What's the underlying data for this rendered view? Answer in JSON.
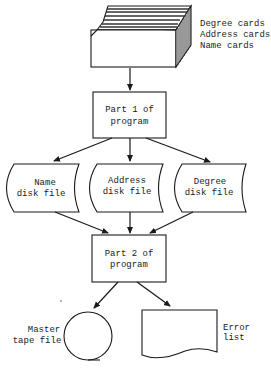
{
  "diagram": {
    "type": "flowchart",
    "colors": {
      "stroke": "#1a1a1a",
      "fill": "#ffffff",
      "text": "#222222"
    },
    "input": {
      "shape": "card-deck",
      "labels": [
        "Degree cards",
        "Address cards",
        "Name cards"
      ]
    },
    "part1": {
      "shape": "process",
      "lines": [
        "Part 1 of",
        "program"
      ]
    },
    "disk_files": [
      {
        "shape": "stored-data",
        "lines": [
          "Name",
          "disk file"
        ]
      },
      {
        "shape": "stored-data",
        "lines": [
          "Address",
          "disk file"
        ]
      },
      {
        "shape": "stored-data",
        "lines": [
          "Degree",
          "disk file"
        ]
      }
    ],
    "part2": {
      "shape": "process",
      "lines": [
        "Part 2 of",
        "program"
      ]
    },
    "outputs": [
      {
        "shape": "magnetic-tape",
        "lines": [
          "Master",
          "tape file"
        ]
      },
      {
        "shape": "document",
        "lines": [
          "Error",
          "list"
        ]
      }
    ],
    "edges": [
      [
        "card-deck",
        "part1"
      ],
      [
        "part1",
        "name-disk-file"
      ],
      [
        "part1",
        "address-disk-file"
      ],
      [
        "part1",
        "degree-disk-file"
      ],
      [
        "name-disk-file",
        "part2"
      ],
      [
        "address-disk-file",
        "part2"
      ],
      [
        "degree-disk-file",
        "part2"
      ],
      [
        "part2",
        "master-tape-file"
      ],
      [
        "part2",
        "error-list"
      ]
    ]
  }
}
